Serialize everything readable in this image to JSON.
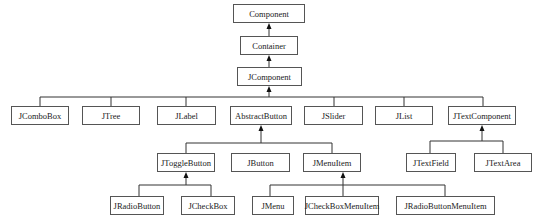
{
  "diagram": {
    "nodes": {
      "component": "Component",
      "container": "Container",
      "jcomponent": "JComponent",
      "jcombobox": "JComboBox",
      "jtree": "JTree",
      "jlabel": "JLabel",
      "abstractbutton": "AbstractButton",
      "jslider": "JSlider",
      "jlist": "JList",
      "jtextcomponent": "JTextComponent",
      "jtogglebutton": "JToggleButton",
      "jbutton": "JButton",
      "jmenuitem": "JMenuItem",
      "jtextfield": "JTextField",
      "jtextarea": "JTextArea",
      "jradiobutton": "JRadioButton",
      "jcheckbox": "JCheckBox",
      "jmenu": "JMenu",
      "jcheckboxmenuitem": "JCheckBoxMenuItem",
      "jradiobuttonmenuitem": "JRadioButtonMenuItem"
    },
    "edges": [
      {
        "from": "Container",
        "to": "Component"
      },
      {
        "from": "JComponent",
        "to": "Container"
      },
      {
        "from": "JComboBox",
        "to": "JComponent"
      },
      {
        "from": "JTree",
        "to": "JComponent"
      },
      {
        "from": "JLabel",
        "to": "JComponent"
      },
      {
        "from": "AbstractButton",
        "to": "JComponent"
      },
      {
        "from": "JSlider",
        "to": "JComponent"
      },
      {
        "from": "JList",
        "to": "JComponent"
      },
      {
        "from": "JTextComponent",
        "to": "JComponent"
      },
      {
        "from": "JToggleButton",
        "to": "AbstractButton"
      },
      {
        "from": "JButton",
        "to": "AbstractButton"
      },
      {
        "from": "JMenuItem",
        "to": "AbstractButton"
      },
      {
        "from": "JTextField",
        "to": "JTextComponent"
      },
      {
        "from": "JTextArea",
        "to": "JTextComponent"
      },
      {
        "from": "JRadioButton",
        "to": "JToggleButton"
      },
      {
        "from": "JCheckBox",
        "to": "JToggleButton"
      },
      {
        "from": "JMenu",
        "to": "JMenuItem"
      },
      {
        "from": "JCheckBoxMenuItem",
        "to": "JMenuItem"
      },
      {
        "from": "JRadioButtonMenuItem",
        "to": "JMenuItem"
      }
    ],
    "colors": {
      "line": "#333333",
      "box_border": "#555555",
      "text": "#222222"
    }
  }
}
